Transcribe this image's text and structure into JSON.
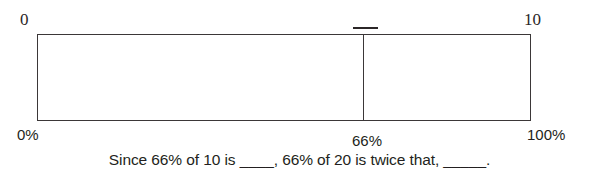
{
  "diagram": {
    "type": "bar-model",
    "top_scale": {
      "start_label": "0",
      "end_label": "10"
    },
    "bottom_scale": {
      "start_label": "0%",
      "divider_label": "66%",
      "end_label": "100%"
    },
    "divider": {
      "position_percent": 66,
      "tick_mark": true
    },
    "caption": "Since 66% of 10 is ____, 66% of 20 is twice that, _____."
  },
  "chart_data": {
    "type": "bar",
    "title": "",
    "xlabel": "",
    "ylabel": "",
    "categories": [
      "0 to 66%",
      "66% to 100%"
    ],
    "values": [
      66,
      34
    ],
    "x": [
      0,
      66,
      100
    ],
    "tick_labels_top": [
      "0",
      "10"
    ],
    "tick_labels_bottom": [
      "0%",
      "66%",
      "100%"
    ],
    "xlim": [
      0,
      100
    ],
    "grid": false,
    "legend": "none",
    "annotations": [
      "Since 66% of 10 is ____, 66% of 20 is twice that, _____."
    ]
  },
  "colors": {
    "stroke": "#3b3738",
    "text": "#231f20",
    "background": "#ffffff"
  }
}
